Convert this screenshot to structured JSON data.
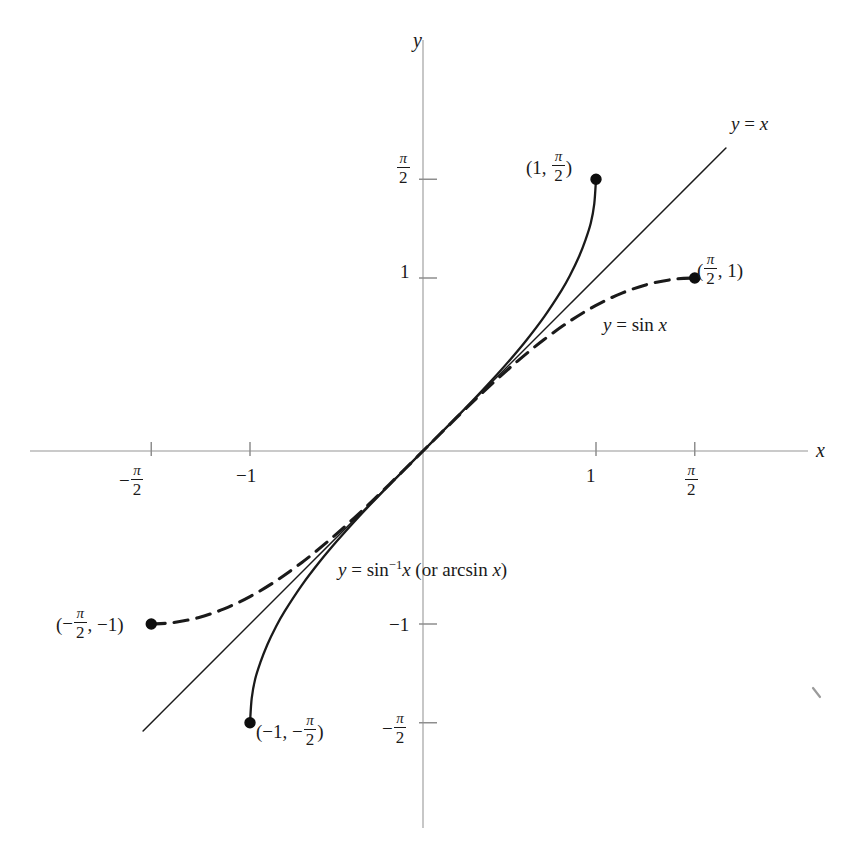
{
  "figure": {
    "kind": "math-graph",
    "background_color": "#ffffff",
    "ink_color": "#1a1a1a",
    "axis_color": "#b8b8b8"
  },
  "axes": {
    "x_axis_label": "x",
    "y_axis_label": "y",
    "x_ticks": [
      {
        "value": -1.5708,
        "label_parts": {
          "sign": "−",
          "num": "π",
          "den": "2"
        },
        "px": 146
      },
      {
        "value": -1,
        "label": "−1",
        "px": 250
      },
      {
        "value": 1,
        "label": "1",
        "px": 591
      },
      {
        "value": 1.5708,
        "label_parts": {
          "sign": "",
          "num": "π",
          "den": "2"
        },
        "px": 693
      }
    ],
    "y_ticks": [
      {
        "value": 1.5708,
        "label_parts": {
          "sign": "",
          "num": "π",
          "den": "2"
        },
        "px": 168
      },
      {
        "value": 1,
        "label": "1",
        "px": 272
      },
      {
        "value": -1,
        "label": "−1",
        "px": 625
      },
      {
        "value": -1.5708,
        "label_parts": {
          "sign": "−",
          "num": "π",
          "den": "2"
        },
        "px": 728
      }
    ],
    "origin_px": {
      "x": 423,
      "y": 451
    },
    "unit_px": 173,
    "x_range": [
      -2.27,
      2.54
    ],
    "y_range": [
      -2.41,
      2.38
    ]
  },
  "chart_data": {
    "type": "line",
    "title": "",
    "xlabel": "x",
    "ylabel": "y",
    "grid": false,
    "legend": "inline-annotations",
    "xlim": [
      -2.27,
      2.54
    ],
    "ylim": [
      -2.41,
      2.38
    ],
    "series": [
      {
        "name": "y = sin^-1 x (or arcsin x)",
        "label": "y = sin⁻¹x (or arcsin x)",
        "style": "solid",
        "color": "#1a1a1a",
        "domain": [
          -1,
          1
        ],
        "range": [
          -1.5708,
          1.5708
        ],
        "endpoints": [
          {
            "x": -1,
            "y": -1.5708,
            "label": "(−1, −π/2)",
            "filled": true
          },
          {
            "x": 1,
            "y": 1.5708,
            "label": "(1, π/2)",
            "filled": true
          }
        ],
        "points": [
          {
            "x": -1.0,
            "y": -1.5708
          },
          {
            "x": -0.99,
            "y": -1.4287
          },
          {
            "x": -0.97,
            "y": -1.3181
          },
          {
            "x": -0.94,
            "y": -1.2225
          },
          {
            "x": -0.9,
            "y": -1.1198
          },
          {
            "x": -0.85,
            "y": -1.016
          },
          {
            "x": -0.8,
            "y": -0.9273
          },
          {
            "x": -0.7,
            "y": -0.7754
          },
          {
            "x": -0.6,
            "y": -0.6435
          },
          {
            "x": -0.5,
            "y": -0.5236
          },
          {
            "x": -0.4,
            "y": -0.4115
          },
          {
            "x": -0.3,
            "y": -0.3047
          },
          {
            "x": -0.2,
            "y": -0.2014
          },
          {
            "x": -0.1,
            "y": -0.1002
          },
          {
            "x": 0.0,
            "y": 0.0
          },
          {
            "x": 0.1,
            "y": 0.1002
          },
          {
            "x": 0.2,
            "y": 0.2014
          },
          {
            "x": 0.3,
            "y": 0.3047
          },
          {
            "x": 0.4,
            "y": 0.4115
          },
          {
            "x": 0.5,
            "y": 0.5236
          },
          {
            "x": 0.6,
            "y": 0.6435
          },
          {
            "x": 0.7,
            "y": 0.7754
          },
          {
            "x": 0.8,
            "y": 0.9273
          },
          {
            "x": 0.85,
            "y": 1.016
          },
          {
            "x": 0.9,
            "y": 1.1198
          },
          {
            "x": 0.94,
            "y": 1.2225
          },
          {
            "x": 0.97,
            "y": 1.3181
          },
          {
            "x": 0.99,
            "y": 1.4287
          },
          {
            "x": 1.0,
            "y": 1.5708
          }
        ]
      },
      {
        "name": "y = sin x",
        "label": "y = sin x",
        "style": "dashed",
        "color": "#1a1a1a",
        "dash_pattern": "14 9",
        "domain": [
          -1.5708,
          1.5708
        ],
        "range": [
          -1,
          1
        ],
        "endpoints": [
          {
            "x": -1.5708,
            "y": -1,
            "label": "(−π/2, −1)",
            "filled": true
          },
          {
            "x": 1.5708,
            "y": 1,
            "label": "(π/2, 1)",
            "filled": true
          }
        ],
        "points": [
          {
            "x": -1.5708,
            "y": -1.0
          },
          {
            "x": -1.45,
            "y": -0.9927
          },
          {
            "x": -1.3,
            "y": -0.9636
          },
          {
            "x": -1.15,
            "y": -0.9128
          },
          {
            "x": -1.0,
            "y": -0.8415
          },
          {
            "x": -0.85,
            "y": -0.7513
          },
          {
            "x": -0.7,
            "y": -0.6442
          },
          {
            "x": -0.55,
            "y": -0.5227
          },
          {
            "x": -0.4,
            "y": -0.3894
          },
          {
            "x": -0.25,
            "y": -0.2474
          },
          {
            "x": -0.1,
            "y": -0.0998
          },
          {
            "x": 0.0,
            "y": 0.0
          },
          {
            "x": 0.1,
            "y": 0.0998
          },
          {
            "x": 0.25,
            "y": 0.2474
          },
          {
            "x": 0.4,
            "y": 0.3894
          },
          {
            "x": 0.55,
            "y": 0.5227
          },
          {
            "x": 0.7,
            "y": 0.6442
          },
          {
            "x": 0.85,
            "y": 0.7513
          },
          {
            "x": 1.0,
            "y": 0.8415
          },
          {
            "x": 1.15,
            "y": 0.9128
          },
          {
            "x": 1.3,
            "y": 0.9636
          },
          {
            "x": 1.45,
            "y": 0.9927
          },
          {
            "x": 1.5708,
            "y": 1.0
          }
        ]
      },
      {
        "name": "y = x",
        "label": "y = x",
        "style": "solid",
        "color": "#1a1a1a",
        "domain": [
          -1.618,
          1.751
        ],
        "points": [
          {
            "x": -1.618,
            "y": -1.618
          },
          {
            "x": 1.751,
            "y": 1.751
          }
        ]
      }
    ]
  },
  "annotations": {
    "y_eq_x": {
      "text": "y = x",
      "x_px": 731,
      "y_px": 114
    },
    "y_eq_sin_x": {
      "text_prefix": "y = sin ",
      "text_var": "x",
      "x_px": 603,
      "y_px": 325
    },
    "arcsin": {
      "lhs": "y",
      "eq": " = sin",
      "exp": "−1",
      "var": "x",
      "tail": " (or arcsin ",
      "var2": "x",
      "close": ")",
      "x_px": 338,
      "y_px": 570
    },
    "pt_1_pihalf": {
      "x_px": 528,
      "y_px": 155,
      "dot_px": {
        "x": 590,
        "y": 165
      }
    },
    "pt_pihalf_1": {
      "x_px": 697,
      "y_px": 258,
      "dot_px": {
        "x": 690,
        "y": 268
      }
    },
    "pt_neg_pihalf_neg1": {
      "x_px": 58,
      "y_px": 612,
      "dot_px": {
        "x": 150,
        "y": 622
      }
    },
    "pt_neg1_neg_pihalf": {
      "x_px": 257,
      "y_px": 719,
      "dot_px": {
        "x": 250,
        "y": 729
      }
    }
  }
}
